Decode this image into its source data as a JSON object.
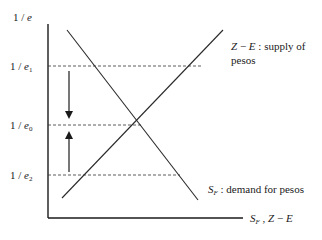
{
  "diagram": {
    "type": "supply-demand",
    "y_axis_label": "1/e",
    "x_axis_label": "S_F, Z − E",
    "y_levels": [
      {
        "label": "1/e1",
        "name": "1/e",
        "sub": "1",
        "y": 66,
        "dash_end_x": 203
      },
      {
        "label": "1/e0",
        "name": "1/e",
        "sub": "0",
        "y": 125,
        "dash_end_x": 141
      },
      {
        "label": "1/e2",
        "name": "1/e",
        "sub": "2",
        "y": 175,
        "dash_end_x": 180
      }
    ],
    "curves": [
      {
        "id": "supply",
        "label_main": "Z − E",
        "label_text": ": supply of",
        "label_line2": "pesos",
        "slope": "upward",
        "x1": 62,
        "y1": 198,
        "x2": 223,
        "y2": 30
      },
      {
        "id": "demand",
        "label_main": "S",
        "label_sub": "F",
        "label_text": ": demand for pesos",
        "slope": "downward",
        "x1": 67,
        "y1": 30,
        "x2": 198,
        "y2": 200
      }
    ],
    "arrows": [
      {
        "direction": "down",
        "from_level": "1/e1",
        "toward": "1/e0"
      },
      {
        "direction": "up",
        "from_level": "1/e2",
        "toward": "1/e0"
      }
    ],
    "equilibrium": {
      "x": 141,
      "y": 125
    },
    "colors": {
      "axis": "#1a1a1a",
      "curve": "#2a2a2a",
      "dash": "#333333",
      "arrow": "#555555"
    }
  }
}
